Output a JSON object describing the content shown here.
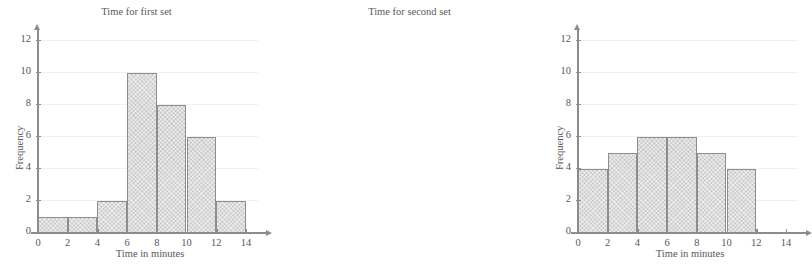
{
  "top_clipped_text": "",
  "axis": {
    "x_title": "Time in minutes",
    "y_title": "Frequency",
    "x_ticks": [
      "0",
      "2",
      "4",
      "6",
      "8",
      "10",
      "12",
      "14"
    ],
    "y_ticks": [
      "0",
      "2",
      "4",
      "6",
      "8",
      "10",
      "12"
    ]
  },
  "colors": {
    "bar_fill": "#c9c9c9",
    "bar_border": "#8c8c91",
    "axis": "#8b8b90",
    "grid": "#f1f1f4",
    "text": "#56565b"
  },
  "chart_data": [
    {
      "type": "bar",
      "title": "Time for first set",
      "xlabel": "Time in minutes",
      "ylabel": "Frequency",
      "xlim": [
        0,
        15
      ],
      "ylim": [
        0,
        13
      ],
      "xticks": [
        0,
        2,
        4,
        6,
        8,
        10,
        12,
        14
      ],
      "yticks": [
        0,
        2,
        4,
        6,
        8,
        10,
        12
      ],
      "grid": true,
      "legend": null,
      "bin_width": 2,
      "bins": [
        "0-2",
        "2-4",
        "4-6",
        "6-8",
        "8-10",
        "10-12",
        "12-14"
      ],
      "categories": [
        "0-2",
        "2-4",
        "4-6",
        "6-8",
        "8-10",
        "10-12",
        "12-14"
      ],
      "values": [
        1,
        1,
        2,
        10,
        8,
        6,
        2
      ]
    },
    {
      "type": "bar",
      "title": "Time for second set",
      "xlabel": "Time in minutes",
      "ylabel": "Frequency",
      "xlim": [
        0,
        15
      ],
      "ylim": [
        0,
        13
      ],
      "xticks": [
        0,
        2,
        4,
        6,
        8,
        10,
        12,
        14
      ],
      "yticks": [
        0,
        2,
        4,
        6,
        8,
        10,
        12
      ],
      "grid": true,
      "legend": null,
      "bin_width": 2,
      "bins": [
        "0-2",
        "2-4",
        "4-6",
        "6-8",
        "8-10",
        "10-12"
      ],
      "categories": [
        "0-2",
        "2-4",
        "4-6",
        "6-8",
        "8-10",
        "10-12"
      ],
      "values": [
        4,
        5,
        6,
        6,
        5,
        4
      ]
    }
  ]
}
